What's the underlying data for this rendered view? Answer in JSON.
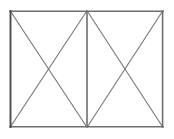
{
  "figure": {
    "background_color": "#ffffff",
    "outline_color": "#6e6e6e",
    "outline_dark_color": "#4a4a4a",
    "diagonal_color": "#757575",
    "divider_color": "#6e6e6e",
    "outline_width": 1.6,
    "divider_width": 1.6,
    "diagonal_width": 1.1,
    "geometry": {
      "left": 10,
      "top": 11,
      "right": 163,
      "bottom": 127,
      "divider_x": 87,
      "width": 153,
      "height": 116
    },
    "panels": [
      {
        "name": "left-panel",
        "x0": 10,
        "y0": 11,
        "x1": 87,
        "y1": 127,
        "cross_x": 48.5,
        "cross_y": 69
      },
      {
        "name": "right-panel",
        "x0": 87,
        "y0": 11,
        "x1": 163,
        "y1": 127,
        "cross_x": 125,
        "cross_y": 69
      }
    ],
    "vertices": {
      "top_left": "10,11",
      "top_right": "163,11",
      "bottom_left": "10,127",
      "bottom_right": "163,127",
      "top_mid": "87,11",
      "bottom_mid": "87,127"
    }
  }
}
